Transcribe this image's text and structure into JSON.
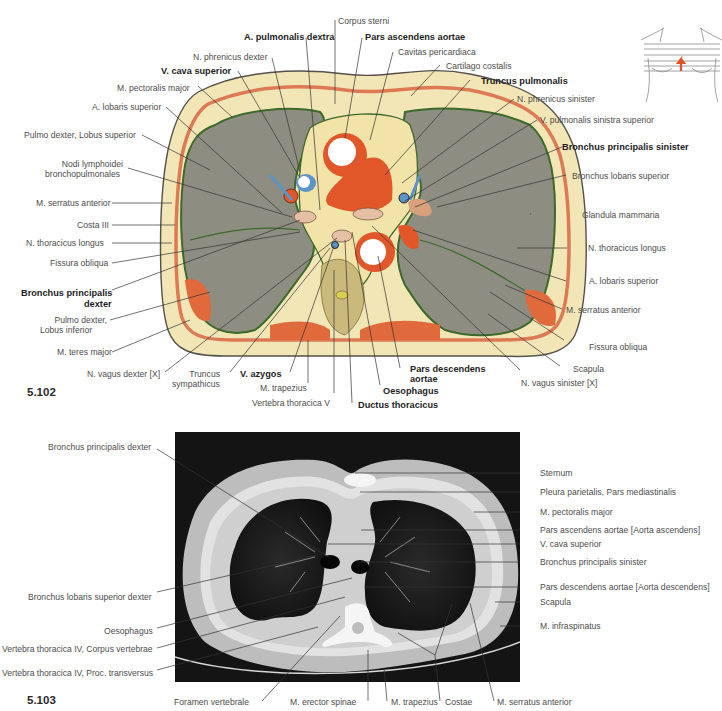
{
  "figure_102": {
    "number": "5.102",
    "labels": {
      "a_pulmonalis_dextra": "A. pulmonalis dextra",
      "corpus_sterni": "Corpus sterni",
      "pars_ascendens_aortae": "Pars ascendens aortae",
      "n_phrenicus_dexter": "N. phrenicus dexter",
      "cavitas_pericardiaca": "Cavitas pericardiaca",
      "v_cava_superior": "V. cava superior",
      "cartilago_costalis": "Cartilago costalis",
      "m_pectoralis_major": "M. pectoralis major",
      "truncus_pulmonalis": "Truncus pulmonalis",
      "a_lobaris_superior_l": "A. lobaris superior",
      "n_phrenicus_sinister": "N. phrenicus sinister",
      "pulmo_dexter_lobus_superior": "Pulmo dexter, Lobus superior",
      "v_pulmonalis_sinistra_superior": "V. pulmonalis sinistra superior",
      "nodi_lymphoidei_1": "Nodi lymphoidei",
      "nodi_lymphoidei_2": "bronchopulmonales",
      "bronchus_principalis_sinister": "Bronchus principalis sinister",
      "bronchus_lobaris_superior": "Bronchus lobaris superior",
      "m_serratus_anterior_l": "M. serratus anterior",
      "costa_iii": "Costa III",
      "glandula_mammaria": "Glandula mammaria",
      "n_thoracicus_longus_l": "N. thoracicus longus",
      "n_thoracicus_longus_r": "N. thoracicus longus",
      "fissura_obliqua_l": "Fissura obliqua",
      "a_lobaris_superior_r": "A. lobaris superior",
      "bronchus_principalis_dexter_1": "Bronchus principalis",
      "bronchus_principalis_dexter_2": "dexter",
      "m_serratus_anterior_r": "M. serratus anterior",
      "pulmo_dexter_lobus_inferior_1": "Pulmo dexter,",
      "pulmo_dexter_lobus_inferior_2": "Lobus inferior",
      "m_teres_major": "M. teres major",
      "fissura_obliqua_r": "Fissura obliqua",
      "scapula": "Scapula",
      "n_vagus_dexter": "N. vagus dexter [X]",
      "truncus_sympathicus_1": "Truncus",
      "truncus_sympathicus_2": "sympathicus",
      "v_azygos": "V. azygos",
      "pars_descendens_aortae_1": "Pars descendens",
      "pars_descendens_aortae_2": "aortae",
      "n_vagus_sinister": "N. vagus sinister [X]",
      "m_trapezius": "M. trapezius",
      "oesophagus": "Oesophagus",
      "vertebra_thoracica_v": "Vertebra thoracica V",
      "ductus_thoracicus": "Ductus thoracicus"
    }
  },
  "figure_103": {
    "number": "5.103",
    "labels": {
      "bronchus_principalis_dexter": "Bronchus principalis dexter",
      "sternum": "Sternum",
      "pleura_parietalis": "Pleura parietalis, Pars mediastinalis",
      "m_pectoralis_major": "M. pectoralis major",
      "pars_ascendens_aortae": "Pars ascendens aortae [Aorta ascendens]",
      "v_cava_superior": "V. cava superior",
      "bronchus_principalis_sinister": "Bronchus principalis sinister",
      "bronchus_lobaris_superior_dexter": "Bronchus lobaris superior dexter",
      "pars_descendens_aortae": "Pars descendens aortae [Aorta descendens]",
      "scapula": "Scapula",
      "oesophagus": "Oesophagus",
      "m_infraspinatus": "M. infraspinatus",
      "vertebra_corpus": "Vertebra thoracica IV, Corpus vertebrae",
      "vertebra_proc": "Vertebra thoracica IV, Proc. transversus",
      "foramen_vertebrale": "Foramen vertebrale",
      "m_erector_spinae": "M. erector spinae",
      "m_trapezius": "M. trapezius",
      "costae": "Costae",
      "m_serratus_anterior": "M. serratus anterior"
    }
  },
  "icons": {
    "orientation": "torso-section-level-icon"
  },
  "colors": {
    "lung": "#8c8b80",
    "fat": "#f2e4b0",
    "muscle": "#e06a3c",
    "pleura": "#3e6b2c",
    "aorta": "#e2572a",
    "vein": "#5b94c8",
    "ct_bg": "#141414"
  }
}
